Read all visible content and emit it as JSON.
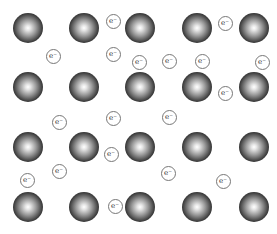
{
  "diagram": {
    "title": "",
    "ion_radius": 15,
    "electron_radius": 8,
    "electron_label": "e⁻",
    "ion_grid": {
      "columns_x": [
        28,
        84,
        140,
        197,
        254
      ],
      "rows_y": [
        28,
        87,
        147,
        207
      ]
    },
    "electrons": [
      {
        "x": 113,
        "y": 21
      },
      {
        "x": 225,
        "y": 23
      },
      {
        "x": 53,
        "y": 56
      },
      {
        "x": 113,
        "y": 54
      },
      {
        "x": 139,
        "y": 62
      },
      {
        "x": 169,
        "y": 61
      },
      {
        "x": 202,
        "y": 61
      },
      {
        "x": 262,
        "y": 62
      },
      {
        "x": 225,
        "y": 93
      },
      {
        "x": 59,
        "y": 122
      },
      {
        "x": 113,
        "y": 118
      },
      {
        "x": 169,
        "y": 117
      },
      {
        "x": 111,
        "y": 154
      },
      {
        "x": 168,
        "y": 173
      },
      {
        "x": 59,
        "y": 171
      },
      {
        "x": 223,
        "y": 181
      },
      {
        "x": 27,
        "y": 180
      },
      {
        "x": 115,
        "y": 206
      }
    ]
  }
}
